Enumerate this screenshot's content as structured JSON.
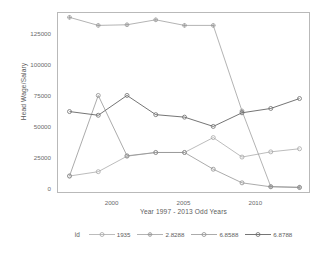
{
  "chart_data": {
    "type": "line",
    "title": "",
    "xlabel": "Year 1997 - 2013 Odd Years",
    "ylabel": "Head Wage/Salary",
    "x": [
      1997,
      1999,
      2001,
      2003,
      2005,
      2007,
      2009,
      2011,
      2013
    ],
    "xlim": [
      1996.2,
      2013.8
    ],
    "ylim": [
      -4000,
      142000
    ],
    "xticks": [
      2000,
      2005,
      2010
    ],
    "xticklabels": [
      "2000",
      "2005",
      "2010"
    ],
    "yticks": [
      0,
      25000,
      50000,
      75000,
      100000,
      125000
    ],
    "yticklabels": [
      "0",
      "25000",
      "50000",
      "75000",
      "100000",
      "125000"
    ],
    "grid": false,
    "legend_position": "bottom",
    "legend_title": "id",
    "series": [
      {
        "name": "1935",
        "color": "#a6a6a6",
        "marker": "circle",
        "values": [
          10500,
          14000,
          26500,
          29500,
          29500,
          41500,
          25800,
          30000,
          32500
        ]
      },
      {
        "name": "2.8288",
        "color": "#9a9a9a",
        "marker": "plus",
        "values": [
          138500,
          132000,
          132500,
          136500,
          132000,
          132000,
          63000,
          2000,
          1500
        ]
      },
      {
        "name": "6.8588",
        "color": "#8f8f8f",
        "marker": "circle",
        "values": [
          10500,
          75500,
          26800,
          29500,
          29500,
          16000,
          5000,
          1800,
          1200
        ]
      },
      {
        "name": "6.8788",
        "color": "#6e6e6e",
        "marker": "circle",
        "values": [
          62500,
          59500,
          75500,
          60000,
          58000,
          50500,
          61500,
          65000,
          73000
        ]
      }
    ]
  },
  "axes": {
    "y_title": "Head Wage/Salary",
    "x_title": "Year 1997 - 2013 Odd Years"
  },
  "legend": {
    "title": "id",
    "items": [
      {
        "label": "1935"
      },
      {
        "label": "2.8288"
      },
      {
        "label": "6.8588"
      },
      {
        "label": "6.8788"
      }
    ]
  }
}
